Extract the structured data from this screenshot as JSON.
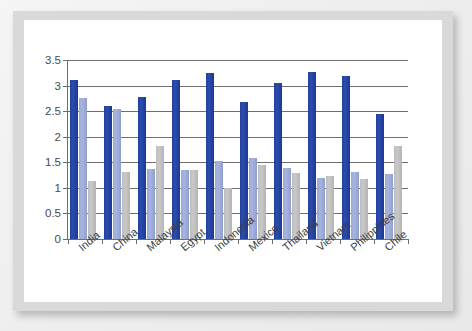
{
  "chart_data": {
    "type": "bar",
    "title": "",
    "subtitle": "",
    "xlabel": "",
    "ylabel": "",
    "ylim": [
      0,
      3.5
    ],
    "yticks": [
      "0",
      "0.5",
      "1",
      "1.5",
      "2",
      "2.5",
      "3",
      "3.5"
    ],
    "ytick_values": [
      0,
      0.5,
      1,
      1.5,
      2,
      2.5,
      3,
      3.5
    ],
    "grid": true,
    "legend_position": "bottom",
    "categories": [
      "India",
      "China",
      "Malaysia",
      "Egypt",
      "Indonesia",
      "Mexico",
      "Thailand",
      "Vietnam",
      "Philippines",
      "Chile"
    ],
    "series": [
      {
        "name": "Financial Attractiveness",
        "color": "#21409a",
        "values": [
          3.11,
          2.61,
          2.78,
          3.1,
          3.24,
          2.68,
          3.05,
          3.27,
          3.19,
          2.45
        ]
      },
      {
        "name": "People Skills",
        "color": "#9aa9d8",
        "values": [
          2.75,
          2.55,
          1.36,
          1.35,
          1.52,
          1.59,
          1.38,
          1.19,
          1.31,
          1.28
        ]
      },
      {
        "name": "Business Environment",
        "color": "#bdbdbd",
        "values": [
          1.14,
          1.31,
          1.81,
          1.35,
          1.0,
          1.44,
          1.3,
          1.24,
          1.17,
          1.81
        ]
      }
    ]
  },
  "legend": {
    "items": [
      {
        "label": "Financial Attractiveness",
        "color": "#21409a"
      },
      {
        "label": "People Skills",
        "color": "#9aa9d8"
      },
      {
        "label": "Business Environment",
        "color": "#bdbdbd"
      }
    ]
  }
}
